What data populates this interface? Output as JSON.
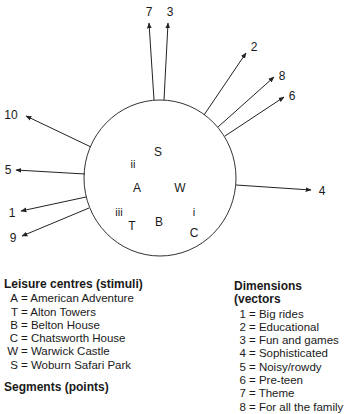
{
  "chart_data": {
    "type": "perceptual-map",
    "circle": {
      "cx": 160,
      "cy": 178,
      "rx": 76,
      "ry": 78
    },
    "vectors": [
      {
        "id": "7",
        "x1": 154,
        "y1": 100,
        "x2": 149,
        "y2": 23,
        "lx": 149,
        "ly": 13
      },
      {
        "id": "3",
        "x1": 164,
        "y1": 100,
        "x2": 168,
        "y2": 23,
        "lx": 170,
        "ly": 13
      },
      {
        "id": "2",
        "x1": 204,
        "y1": 115,
        "x2": 246,
        "y2": 53,
        "lx": 254,
        "ly": 48
      },
      {
        "id": "8",
        "x1": 218,
        "y1": 127,
        "x2": 274,
        "y2": 77,
        "lx": 282,
        "ly": 77
      },
      {
        "id": "6",
        "x1": 225,
        "y1": 136,
        "x2": 284,
        "y2": 97,
        "lx": 292,
        "ly": 97
      },
      {
        "id": "10",
        "x1": 91,
        "y1": 147,
        "x2": 26,
        "y2": 116,
        "lx": 11,
        "ly": 116
      },
      {
        "id": "5",
        "x1": 85,
        "y1": 174,
        "x2": 16,
        "y2": 170,
        "lx": 8,
        "ly": 171
      },
      {
        "id": "1",
        "x1": 86,
        "y1": 197,
        "x2": 21,
        "y2": 211,
        "lx": 12,
        "ly": 214
      },
      {
        "id": "9",
        "x1": 89,
        "y1": 208,
        "x2": 22,
        "y2": 236,
        "lx": 13,
        "ly": 239
      },
      {
        "id": "4",
        "x1": 236,
        "y1": 185,
        "x2": 311,
        "y2": 190,
        "lx": 322,
        "ly": 192
      }
    ],
    "stimuli_points": [
      {
        "label": "S",
        "x": 158,
        "y": 153
      },
      {
        "label": "A",
        "x": 137,
        "y": 189
      },
      {
        "label": "W",
        "x": 180,
        "y": 189
      },
      {
        "label": "T",
        "x": 132,
        "y": 227
      },
      {
        "label": "B",
        "x": 159,
        "y": 223
      },
      {
        "label": "C",
        "x": 194,
        "y": 234
      }
    ],
    "segment_points": [
      {
        "label": "ii",
        "x": 133,
        "y": 165
      },
      {
        "label": "iii",
        "x": 119,
        "y": 213
      },
      {
        "label": "i",
        "x": 194,
        "y": 213
      }
    ]
  },
  "legend_stimuli": {
    "title": "Leisure centres (stimuli)",
    "items": [
      {
        "key": "A",
        "text": "= American Adventure"
      },
      {
        "key": "T",
        "text": "= Alton Towers"
      },
      {
        "key": "B",
        "text": "= Belton House"
      },
      {
        "key": "C",
        "text": "= Chatsworth House"
      },
      {
        "key": "W",
        "text": "= Warwick Castle"
      },
      {
        "key": "S",
        "text": "= Woburn Safari Park"
      }
    ]
  },
  "legend_segments": {
    "title": "Segments (points)"
  },
  "legend_dimensions": {
    "title": "Dimensions (vectors",
    "items": [
      {
        "key": "1",
        "text": "= Big rides"
      },
      {
        "key": "2",
        "text": "= Educational"
      },
      {
        "key": "3",
        "text": "= Fun and games"
      },
      {
        "key": "4",
        "text": "= Sophisticated"
      },
      {
        "key": "5",
        "text": "= Noisy/rowdy"
      },
      {
        "key": "6",
        "text": "= Pre-teen"
      },
      {
        "key": "7",
        "text": "= Theme"
      },
      {
        "key": "8",
        "text": "= For all the family"
      }
    ]
  }
}
